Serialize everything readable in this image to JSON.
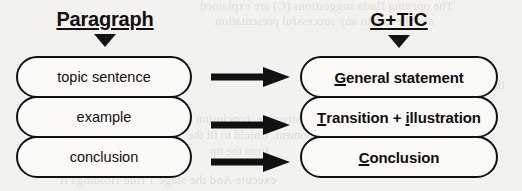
{
  "diagram": {
    "type": "two-column-mapping",
    "background_color": "#f4f2ee",
    "ink_color": "#121111",
    "columns": [
      {
        "id": "paragraph",
        "heading": "Paragraph",
        "marker_icon": "triangle-down-icon",
        "items": [
          {
            "label": "topic sentence",
            "emphasis": ""
          },
          {
            "label": "example",
            "emphasis": ""
          },
          {
            "label": "conclusion",
            "emphasis": ""
          }
        ]
      },
      {
        "id": "gtic",
        "heading": "G+TiC",
        "marker_icon": "triangle-down-icon",
        "items": [
          {
            "label": "General statement",
            "emphasis": "G"
          },
          {
            "label": "Transition + illustration",
            "emphasis": "T, i"
          },
          {
            "label": "Conclusion",
            "emphasis": "C"
          }
        ]
      }
    ],
    "connectors": [
      {
        "id": "arrow-1",
        "icon": "right-arrow-icon",
        "from": "topic sentence",
        "to": "General statement"
      },
      {
        "id": "arrow-2",
        "icon": "right-arrow-icon",
        "from": "example",
        "to": "Transition + illustration"
      },
      {
        "id": "arrow-3",
        "icon": "right-arrow-icon",
        "from": "conclusion",
        "to": "Conclusion"
      }
    ]
  },
  "scan_artifacts": {
    "description": "faint mirrored bleed-through text from the reverse side of the scanned page",
    "lines": [
      "The opening Ilaria suggestions (C) are explained",
      "and the key to any successful presentation.",
      "Using",
      "or from a structure, conclusion",
      "a moment. Unfold to fit the",
      "from the tip",
      "execute   And the stage 1 ride   Holdings it",
      "this introduction of the word first"
    ]
  }
}
